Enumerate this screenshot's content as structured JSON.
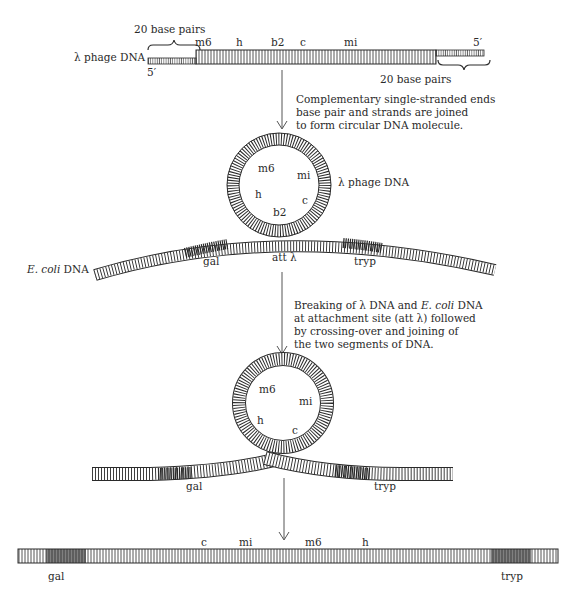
{
  "step1": {
    "molecule_label": "λ phage DNA",
    "left_end_label": "5′",
    "right_end_label": "5′",
    "left_brace_label": "20 base pairs",
    "right_brace_label": "20 base pairs",
    "genes": [
      "m6",
      "h",
      "b2",
      "c",
      "mi"
    ]
  },
  "arrow1_caption": [
    "Complementary single-stranded ends",
    "base pair and strands are joined",
    "to form circular DNA molecule."
  ],
  "step2": {
    "circle_label": "λ phage DNA",
    "circle_genes": [
      "m6",
      "mi",
      "h",
      "c",
      "b2"
    ],
    "ecoli_label_italic": "E. coli",
    "ecoli_label_rest": " DNA",
    "ecoli_genes": [
      "gal",
      "att λ",
      "tryp"
    ]
  },
  "arrow2_caption": {
    "line1_a": "Breaking of λ DNA and ",
    "line1_i": "E. coli",
    "line1_b": " DNA",
    "line2": "at attachment site (att λ) followed",
    "line3": "by crossing-over and joining of",
    "line4": "the two segments of DNA."
  },
  "step3": {
    "circle_genes": [
      "m6",
      "mi",
      "h",
      "c"
    ],
    "ecoli_genes": [
      "gal",
      "tryp"
    ]
  },
  "step4": {
    "inserted_genes": [
      "c",
      "mi",
      "m6",
      "h"
    ],
    "ecoli_genes": [
      "gal",
      "tryp"
    ]
  },
  "colors": {
    "ink": "#2a2a2a",
    "shaded": "#555555",
    "background": "#ffffff"
  }
}
